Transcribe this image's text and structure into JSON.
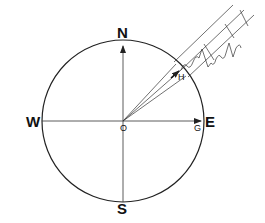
{
  "diagram": {
    "type": "compass-circle-with-incident-wave",
    "center": {
      "x": 123,
      "y": 121
    },
    "radius": 81,
    "colors": {
      "stroke": "#222222",
      "background": "#ffffff"
    },
    "labels": {
      "north": "N",
      "south": "S",
      "west": "W",
      "east": "E",
      "origin": "O",
      "point_g": "G",
      "point_h": "H"
    },
    "elements": [
      {
        "name": "circle",
        "description": "Circle centred on O"
      },
      {
        "name": "ns-axis",
        "description": "Vertical line from S to N, arrow at N"
      },
      {
        "name": "we-axis",
        "description": "Horizontal line from W to E, arrow at G near E"
      },
      {
        "name": "incident-beam",
        "description": "Parallel band of lines arriving from the NE toward O, carrying an oscillating wave"
      },
      {
        "name": "vector-OH",
        "description": "Arrow from O to H on circle in the NE direction"
      }
    ]
  }
}
